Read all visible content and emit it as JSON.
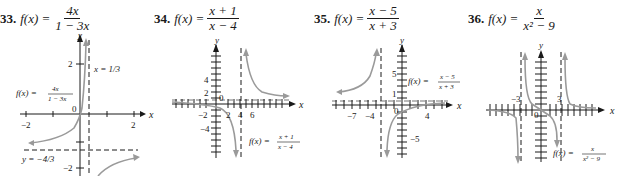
{
  "problems": [
    {
      "number": "33.",
      "function_label": "f(x) =",
      "numerator": "4x",
      "denominator": "1 − 3x",
      "graph": {
        "axis_x_label": "x",
        "axis_y_label": "y",
        "x_ticks": [
          "−2",
          "2"
        ],
        "y_ticks": [
          "2",
          "−2"
        ],
        "origin_label": "0",
        "vertical_asymptote": "x = 1/3",
        "horizontal_asymptote": "y = −4/3",
        "curve_label_lhs": "f(x) =",
        "curve_label_num": "4x",
        "curve_label_den": "1 − 3x"
      }
    },
    {
      "number": "34.",
      "function_label": "f(x) =",
      "numerator": "x + 1",
      "denominator": "x − 4",
      "graph": {
        "axis_x_label": "x",
        "axis_y_label": "y",
        "x_ticks": [
          "−2",
          "2",
          "4",
          "6"
        ],
        "y_ticks": [
          "4",
          "2",
          "−2",
          "−4"
        ],
        "origin_label": "0",
        "curve_label_lhs": "f(x) =",
        "curve_label_num": "x + 1",
        "curve_label_den": "x − 4"
      }
    },
    {
      "number": "35.",
      "function_label": "f(x) =",
      "numerator": "x − 5",
      "denominator": "x + 3",
      "graph": {
        "axis_x_label": "x",
        "axis_y_label": "y",
        "x_ticks": [
          "−7",
          "−4",
          "4"
        ],
        "y_ticks": [
          "5",
          "1",
          "−5"
        ],
        "origin_label": "0",
        "curve_label_lhs": "f(x) =",
        "curve_label_num": "x − 5",
        "curve_label_den": "x + 3"
      }
    },
    {
      "number": "36.",
      "function_label": "f(x) =",
      "numerator": "x",
      "denominator": "x² − 9",
      "graph": {
        "axis_x_label": "x",
        "axis_y_label": "y",
        "x_ticks": [
          "−3",
          "3"
        ],
        "origin_label": "0",
        "curve_label_lhs": "f(x) =",
        "curve_label_num": "x",
        "curve_label_den": "x² − 9"
      }
    }
  ],
  "colors": {
    "curve": "#9a9a9a",
    "axis": "#1a1a1a",
    "text": "#1a1a1a"
  }
}
